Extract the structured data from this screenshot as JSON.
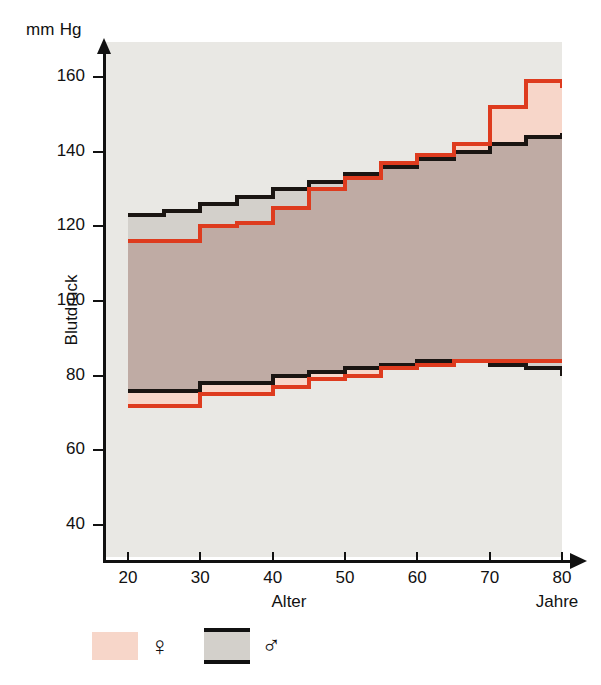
{
  "axes": {
    "y_unit": "mm Hg",
    "y_title": "Blutdruck",
    "x_title": "Alter",
    "x_unit": "Jahre",
    "y_ticks": [
      160,
      140,
      120,
      100,
      80,
      60,
      40
    ],
    "x_ticks": [
      20,
      30,
      40,
      50,
      60,
      70,
      80
    ]
  },
  "legend": {
    "items": [
      {
        "symbol": "♀",
        "name": "female",
        "color": "#f7d6c9",
        "label": "weiblich"
      },
      {
        "symbol": "♂",
        "name": "male",
        "color": "#d3d0cb",
        "label": "männlich"
      }
    ]
  },
  "colors": {
    "female_line": "#de3b1e",
    "male_line": "#1a1512",
    "female_fill": "#f7d6c9",
    "male_fill": "#d3d0cb",
    "overlap_fill": "#bfaba4",
    "plot_background": "#e9e8e4",
    "page_background": "#ffffff"
  },
  "chart_data": {
    "type": "area",
    "title": "",
    "subtitle": "",
    "xlabel": "Alter",
    "ylabel": "Blutdruck",
    "x_unit": "Jahre",
    "y_unit": "mm Hg",
    "xlim": [
      20,
      80
    ],
    "ylim": [
      30,
      165
    ],
    "grid": false,
    "legend_position": "below-left",
    "step_style": "post",
    "x": [
      20,
      25,
      30,
      35,
      40,
      45,
      50,
      55,
      60,
      65,
      70,
      75,
      80
    ],
    "series": [
      {
        "name": "male-systolic",
        "sex": "male",
        "kind": "systolic",
        "color": "#1a1512",
        "values": [
          123,
          124,
          126,
          128,
          130,
          132,
          134,
          136,
          138,
          140,
          142,
          144,
          145
        ]
      },
      {
        "name": "male-diastolic",
        "sex": "male",
        "kind": "diastolic",
        "color": "#1a1512",
        "values": [
          76,
          76,
          78,
          78,
          80,
          81,
          82,
          83,
          84,
          84,
          83,
          82,
          80
        ]
      },
      {
        "name": "female-systolic",
        "sex": "female",
        "kind": "systolic",
        "color": "#de3b1e",
        "values": [
          116,
          116,
          120,
          121,
          125,
          130,
          133,
          137,
          139,
          142,
          152,
          159,
          157
        ]
      },
      {
        "name": "female-diastolic",
        "sex": "female",
        "kind": "diastolic",
        "color": "#de3b1e",
        "values": [
          72,
          72,
          75,
          75,
          77,
          79,
          80,
          82,
          83,
          84,
          84,
          84,
          84
        ]
      }
    ]
  }
}
